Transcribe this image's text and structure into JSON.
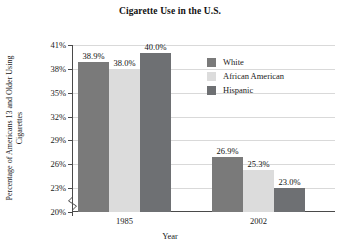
{
  "chart_data": {
    "type": "bar",
    "title": "Cigarette Use in the U.S.",
    "xlabel": "Year",
    "ylabel": "Percentage of Americans 13 and Older Using Cigarettes",
    "categories": [
      "1985",
      "2002"
    ],
    "series": [
      {
        "name": "White",
        "values": [
          38.9,
          38.0
        ],
        "labels": [
          "38.9%",
          "38.0%"
        ],
        "color": "#7a7a7a"
      },
      {
        "name": "African American",
        "values": [
          38.0,
          25.3
        ],
        "labels": [
          "38.0%",
          "25.3%"
        ],
        "color": "#dcdcdc"
      },
      {
        "name": "Hispanic",
        "values": [
          40.0,
          23.0
        ],
        "labels": [
          "40.0%",
          "23.0%"
        ],
        "color": "#6e7073"
      }
    ],
    "series_by_group": [
      {
        "group": "1985",
        "values": [
          38.9,
          38.0,
          40.0
        ],
        "labels": [
          "38.9%",
          "38.0%",
          "40.0%"
        ]
      },
      {
        "group": "2002",
        "values": [
          26.9,
          25.3,
          23.0
        ],
        "labels": [
          "26.9%",
          "25.3%",
          "23.0%"
        ]
      }
    ],
    "bars": [
      {
        "group": "1985",
        "series": "White",
        "value": 38.9,
        "label": "38.9%"
      },
      {
        "group": "1985",
        "series": "African American",
        "value": 38.0,
        "label": "38.0%"
      },
      {
        "group": "1985",
        "series": "Hispanic",
        "value": 40.0,
        "label": "40.0%"
      },
      {
        "group": "2002",
        "series": "White",
        "value": 26.9,
        "label": "26.9%"
      },
      {
        "group": "2002",
        "series": "African American",
        "value": 25.3,
        "label": "25.3%"
      },
      {
        "group": "2002",
        "series": "Hispanic",
        "value": 23.0,
        "label": "23.0%"
      }
    ],
    "ylim": [
      20,
      41
    ],
    "yticks": [
      20,
      23,
      26,
      29,
      32,
      35,
      38,
      41
    ],
    "ytick_labels": [
      "20%",
      "23%",
      "26%",
      "29%",
      "32%",
      "35%",
      "38%",
      "41%"
    ],
    "grid": true,
    "legend_position": "inside-top-right",
    "axis_break": true
  },
  "legend": {
    "items": [
      {
        "label": "White",
        "color": "#7a7a7a"
      },
      {
        "label": "African American",
        "color": "#dcdcdc"
      },
      {
        "label": "Hispanic",
        "color": "#6e7073"
      }
    ]
  },
  "colors": {
    "white_series": "#7a7a7a",
    "african_american_series": "#dcdcdc",
    "hispanic_series": "#6e7073",
    "axis": "#4a4a4a",
    "grid": "#d9d9d9",
    "text": "#1a1a1a",
    "background": "#ffffff"
  }
}
